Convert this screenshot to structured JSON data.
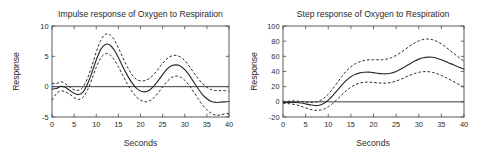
{
  "figure": {
    "width": 489,
    "height": 153,
    "background": "#ffffff",
    "line_color": "#2a2a2a",
    "axis_color": "#4a4a4a"
  },
  "chart_data": [
    {
      "type": "line",
      "panel": "left",
      "title": "Impulse response of Oxygen to Respiration",
      "xlabel": "Seconds",
      "ylabel": "Response",
      "xlim": [
        0,
        40
      ],
      "ylim": [
        -5,
        10
      ],
      "xticks": [
        0,
        5,
        10,
        15,
        20,
        25,
        30,
        35,
        40
      ],
      "yticks": [
        -5,
        0,
        5,
        10
      ],
      "xticklabels": [
        "0",
        "5",
        "10",
        "15",
        "20",
        "25",
        "30",
        "35",
        "40"
      ],
      "yticklabels": [
        "-5",
        "0",
        "5",
        "10"
      ],
      "grid": false,
      "legend": null,
      "zero_reference_line": 0,
      "x": [
        0,
        1,
        2,
        3,
        4,
        5,
        6,
        7,
        8,
        9,
        10,
        11,
        12,
        13,
        14,
        15,
        16,
        17,
        18,
        19,
        20,
        21,
        22,
        23,
        24,
        25,
        26,
        27,
        28,
        29,
        30,
        31,
        32,
        33,
        34,
        35,
        36,
        37,
        38,
        39,
        40
      ],
      "series": [
        {
          "name": "estimate",
          "style": "solid",
          "values": [
            -0.4,
            -0.3,
            0.05,
            -0.1,
            -0.6,
            -1.1,
            -1.3,
            -0.9,
            0.4,
            2.3,
            4.4,
            6.1,
            6.95,
            6.9,
            6.1,
            4.8,
            3.3,
            1.9,
            0.7,
            -0.2,
            -0.7,
            -0.85,
            -0.6,
            0.1,
            1.0,
            2.0,
            2.9,
            3.45,
            3.6,
            3.4,
            2.8,
            1.9,
            0.8,
            -0.3,
            -1.3,
            -2.0,
            -2.45,
            -2.6,
            -2.55,
            -2.5,
            -2.45
          ]
        },
        {
          "name": "upper confidence band",
          "style": "dashed",
          "values": [
            0.55,
            0.5,
            0.8,
            0.5,
            -0.05,
            -0.5,
            -0.6,
            -0.1,
            1.35,
            3.4,
            5.7,
            7.6,
            8.6,
            8.6,
            7.8,
            6.4,
            4.8,
            3.3,
            2.05,
            1.25,
            0.95,
            1.0,
            1.35,
            2.0,
            2.9,
            3.85,
            4.6,
            5.05,
            5.15,
            4.9,
            4.3,
            3.4,
            2.35,
            1.35,
            0.5,
            -0.1,
            -0.5,
            -0.65,
            -0.65,
            -0.65,
            -0.75
          ]
        },
        {
          "name": "lower confidence band",
          "style": "dashed",
          "values": [
            -2.2,
            -1.15,
            -0.7,
            -0.85,
            -1.25,
            -1.8,
            -2.1,
            -1.75,
            -0.6,
            1.2,
            3.2,
            4.7,
            5.4,
            5.3,
            4.5,
            3.3,
            1.85,
            0.5,
            -0.7,
            -1.65,
            -2.2,
            -2.5,
            -2.35,
            -1.85,
            -1.0,
            -0.05,
            0.85,
            1.5,
            1.75,
            1.6,
            1.05,
            0.2,
            -0.85,
            -1.95,
            -3.0,
            -3.8,
            -4.4,
            -4.7,
            -4.65,
            -4.5,
            -4.4
          ]
        }
      ]
    },
    {
      "type": "line",
      "panel": "right",
      "title": "Step response of Oxygen to Respiration",
      "xlabel": "Seconds",
      "ylabel": "Response",
      "xlim": [
        0,
        40
      ],
      "ylim": [
        -20,
        100
      ],
      "xticks": [
        0,
        5,
        10,
        15,
        20,
        25,
        30,
        35,
        40
      ],
      "yticks": [
        -20,
        0,
        20,
        40,
        60,
        80,
        100
      ],
      "xticklabels": [
        "0",
        "5",
        "10",
        "15",
        "20",
        "25",
        "30",
        "35",
        "40"
      ],
      "yticklabels": [
        "-20",
        "0",
        "20",
        "40",
        "60",
        "80",
        "100"
      ],
      "grid": false,
      "legend": null,
      "zero_reference_line": 0,
      "x": [
        0,
        1,
        2,
        3,
        4,
        5,
        6,
        7,
        8,
        9,
        10,
        11,
        12,
        13,
        14,
        15,
        16,
        17,
        18,
        19,
        20,
        21,
        22,
        23,
        24,
        25,
        26,
        27,
        28,
        29,
        30,
        31,
        32,
        33,
        34,
        35,
        36,
        37,
        38,
        39,
        40
      ],
      "series": [
        {
          "name": "estimate",
          "style": "solid",
          "values": [
            -0.4,
            -0.7,
            -0.7,
            -0.9,
            -1.6,
            -2.7,
            -4.0,
            -4.9,
            -4.5,
            -2.2,
            2.2,
            8.3,
            15.2,
            22.1,
            28.2,
            33.0,
            36.3,
            38.2,
            39.0,
            39.2,
            38.5,
            37.6,
            37.0,
            37.1,
            38.1,
            40.1,
            43.0,
            46.4,
            50.0,
            53.5,
            56.3,
            58.2,
            59.0,
            58.8,
            57.5,
            55.5,
            53.0,
            50.4,
            47.9,
            45.4,
            43.0
          ]
        },
        {
          "name": "upper confidence band",
          "style": "dashed",
          "values": [
            0.6,
            0.6,
            1.2,
            1.0,
            0.5,
            -0.3,
            -0.8,
            -0.5,
            1.1,
            4.6,
            10.0,
            17.2,
            25.4,
            33.4,
            40.5,
            46.2,
            50.3,
            53.0,
            54.6,
            55.4,
            55.5,
            55.4,
            55.6,
            56.5,
            58.4,
            61.3,
            65.0,
            69.2,
            73.5,
            77.3,
            80.3,
            82.2,
            82.8,
            82.0,
            79.8,
            76.4,
            72.1,
            67.4,
            62.6,
            58.0,
            53.5
          ]
        },
        {
          "name": "lower confidence band",
          "style": "dashed",
          "values": [
            -2.0,
            -2.3,
            -3.0,
            -4.1,
            -5.8,
            -7.9,
            -9.9,
            -11.1,
            -11.1,
            -9.6,
            -6.5,
            -2.0,
            3.4,
            9.2,
            14.7,
            19.3,
            22.7,
            24.8,
            25.8,
            26.0,
            25.6,
            25.0,
            24.6,
            24.8,
            25.7,
            27.4,
            29.7,
            32.3,
            34.9,
            37.2,
            38.9,
            39.8,
            39.8,
            38.9,
            37.2,
            34.8,
            32.0,
            28.9,
            25.7,
            22.5,
            19.4
          ]
        }
      ]
    }
  ]
}
